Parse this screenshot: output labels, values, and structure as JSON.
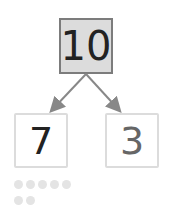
{
  "diagram": {
    "type": "number-bond",
    "whole": "10",
    "parts": [
      "7",
      "3"
    ],
    "dots_row1": 5,
    "dots_row2": 2,
    "colors": {
      "whole_fill": "#dcdcdc",
      "whole_border": "#7c7c7c",
      "arrow": "#888888",
      "dot": "#e4e4e4"
    }
  }
}
